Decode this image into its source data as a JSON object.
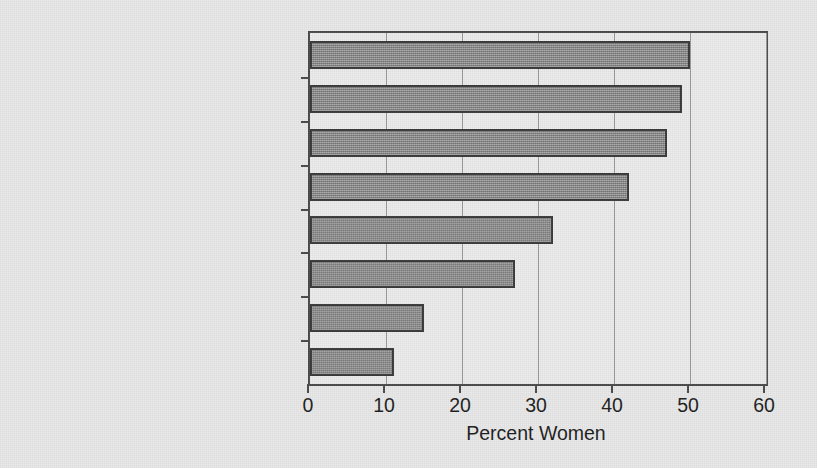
{
  "chart_data": {
    "type": "bar",
    "orientation": "horizontal",
    "title": "",
    "subtitle": "",
    "xlabel": "Percent Women",
    "ylabel": "",
    "xlim": [
      0,
      60
    ],
    "xticks": [
      0,
      10,
      20,
      30,
      40,
      50,
      60
    ],
    "xtick_labels": [
      "0",
      "10",
      "20",
      "30",
      "40",
      "50",
      "60"
    ],
    "grid": true,
    "grid_axis": "x",
    "legend": false,
    "legend_position": "none",
    "categories": [
      "Medical School Applicants",
      "Medical Students",
      "Medical School Graduates",
      "Residents",
      "Medical School Faculty",
      "Associate Professors",
      "Full Professors",
      "Department Chairs"
    ],
    "values": [
      50,
      49,
      47,
      42,
      32,
      27,
      15,
      11
    ],
    "series": [
      {
        "name": "Percent Women",
        "values": [
          50,
          49,
          47,
          42,
          32,
          27,
          15,
          11
        ]
      }
    ],
    "annotations": []
  },
  "style": {
    "page_background": "#e9e9e9",
    "plot_background": "#ececec",
    "bar_fill": "#8d8d8d",
    "bar_edge": "#3a3a3a",
    "axis_color": "#4a4a4a",
    "gridline_color": "#9a9a9a",
    "text_color": "#1d1d1d"
  }
}
